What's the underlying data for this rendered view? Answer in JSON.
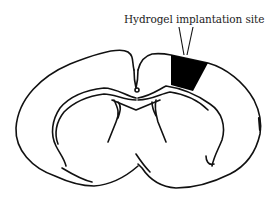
{
  "figure": {
    "annotation_label": "Hydrogel implantation site",
    "colors": {
      "outline": "#111111",
      "implant_fill": "#000000",
      "background": "#ffffff",
      "label_text": "#222222"
    }
  }
}
